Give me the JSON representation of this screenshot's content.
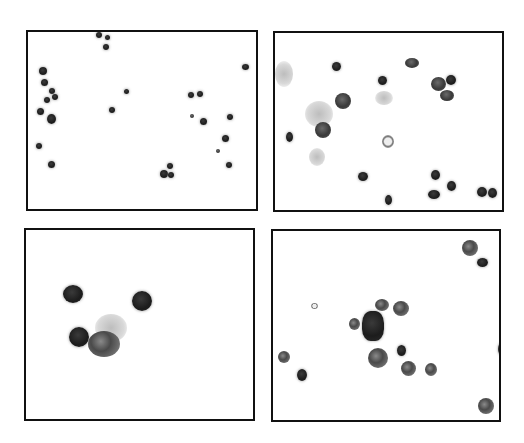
{
  "figure": {
    "type": "micrograph-panel-grid",
    "layout": "2x2",
    "panels": [
      {
        "position": "top-left",
        "description": "low-magnification field with scattered small dark-staining cells"
      },
      {
        "position": "top-right",
        "description": "medium-magnification field with dark nuclei and pale cytoplasm halos"
      },
      {
        "position": "bottom-left",
        "description": "high-magnification view of four cells, one cluster at center"
      },
      {
        "position": "bottom-right",
        "description": "field with irregular granular cells and a dark central aggregate"
      }
    ],
    "colors": {
      "border": "#111111",
      "background": "#ffffff",
      "stain": "#222222"
    }
  }
}
